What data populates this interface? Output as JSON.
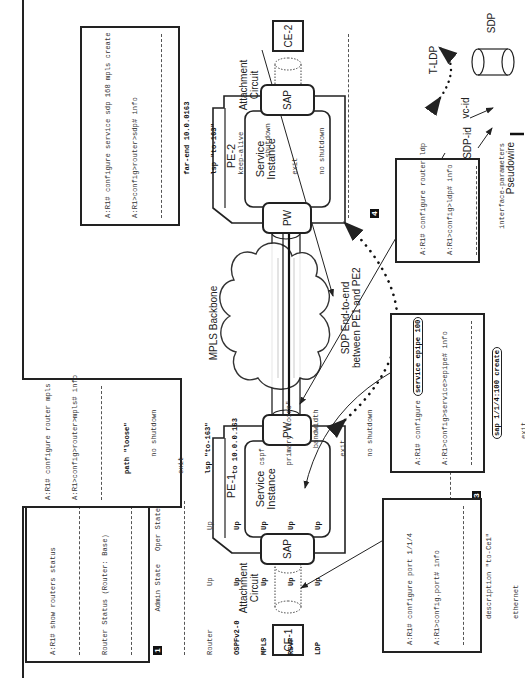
{
  "diagram": {
    "orientation": "rotated 90° counter-clockwise",
    "nodes": {
      "ce1": "CE-1",
      "ce2": "CE-2",
      "pe1": "PE-1",
      "pe2": "PE-2",
      "pe1_service": "Service\nInstance",
      "pe2_service": "Service\nInstance",
      "pe1_sap": "SAP",
      "pe2_sap": "SAP",
      "pe1_pw": "PW",
      "pe2_pw": "PW",
      "attachment_circuit_1": "Attachment\nCircuit",
      "attachment_circuit_2": "Attachment\nCircuit",
      "backbone": "MPLS Backbone",
      "sdp_label": "SDP End-to-end\nbetween PE1 and PE2",
      "sdp_id_label": "SDP-id",
      "vc_id_label": "vc-id"
    },
    "legend": {
      "tldp": "T-LDP",
      "sdp": "SDP",
      "pseudowire": "Pseudowire"
    }
  },
  "terminals": {
    "t1": {
      "badge": "1",
      "prompt": "A:R1# show routers status",
      "header": "Router Status (Router: Base)",
      "col_admin": "Admin State",
      "col_oper": "Oper State",
      "rows": [
        {
          "name": "Router",
          "admin": "Up",
          "oper": "Up"
        },
        {
          "name": "OSPFv2-0",
          "admin": "Up",
          "oper": "Up"
        },
        {
          "name": "MPLS",
          "admin": "Up",
          "oper": "Up"
        },
        {
          "name": "RSVP",
          "admin": "Up",
          "oper": "Up"
        },
        {
          "name": "LDP",
          "admin": "Up",
          "oper": "Up"
        }
      ]
    },
    "t2": {
      "badge": "2",
      "lines": [
        "A:R1# configure router ldp",
        "A:R1>config>ldp# info",
        "interface-parameters",
        "exit",
        "targeted-session",
        "exit"
      ]
    },
    "t3": {
      "badge": "3",
      "lines": [
        "A:R1# configure router mpls",
        "A:R1>config>router>mpls# info",
        "path \"loose\"",
        "no shutdown",
        "exit",
        "lsp \"to-163\"",
        "to 10.0.0.163",
        "cspf",
        "primary \"loose\"",
        "bandwidth",
        "exit",
        "no shutdown",
        "exit",
        "no shutdown"
      ]
    },
    "t4": {
      "badge": "4",
      "lines": [
        "A:R1# configure service sdp 168 mpls create",
        "A:R1>config>router>sdp# info",
        "far-end 10.0.0163",
        "lsp \"to-163\"",
        "keep-alive",
        "shutdown",
        "exit",
        "no shutdown"
      ]
    },
    "t5": {
      "badge": "5",
      "lines": [
        "A:R1# configure port 1/1/4",
        "A:R1>config.port# info",
        "description \"to-Ce1\"",
        "ethernet",
        "mode access",
        "encap-type dotlq",
        "exit",
        "no shutdown"
      ]
    },
    "t6": {
      "badge": "6",
      "lines": [
        "A:R1# configure ",
        "service epipe 100",
        "A:R1>config>service>epipe# info",
        "sap 1/1/4:100 create",
        "exit",
        "spoke-sdp ",
        "163",
        ":",
        "100",
        " create",
        "exit",
        "no shutdown"
      ]
    }
  }
}
